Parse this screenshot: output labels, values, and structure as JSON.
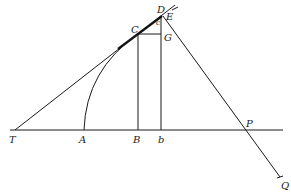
{
  "diagram": {
    "type": "geometric-construction",
    "points": {
      "T": {
        "label": "T",
        "x": 15,
        "y": 130
      },
      "A": {
        "label": "A",
        "x": 84,
        "y": 130
      },
      "B": {
        "label": "B",
        "x": 138,
        "y": 130
      },
      "b": {
        "label": "b",
        "x": 161,
        "y": 130
      },
      "P": {
        "label": "P",
        "x": 246,
        "y": 130
      },
      "Q": {
        "label": "Q",
        "x": 280,
        "y": 177
      },
      "C": {
        "label": "C",
        "x": 138,
        "y": 34
      },
      "G": {
        "label": "G",
        "x": 161,
        "y": 34
      },
      "D": {
        "label": "D",
        "x": 162,
        "y": 15
      },
      "E": {
        "label": "E",
        "x": 163,
        "y": 16
      },
      "c": {
        "label": "c",
        "x": 158,
        "y": 22
      }
    },
    "lines": [
      {
        "name": "baseline",
        "from": "T",
        "to": "end",
        "label": "axis"
      },
      {
        "name": "tangent",
        "from": "T",
        "through": [
          "C",
          "D"
        ]
      },
      {
        "name": "normal",
        "from": "E",
        "through": [
          "P"
        ],
        "to": "Q"
      },
      {
        "name": "ordinate-BC",
        "from": "B",
        "to": "C"
      },
      {
        "name": "ordinate-bD",
        "from": "b",
        "to": "D"
      },
      {
        "name": "CG",
        "from": "C",
        "to": "G"
      },
      {
        "name": "curve-arc",
        "from": "A",
        "to": "C"
      }
    ]
  }
}
